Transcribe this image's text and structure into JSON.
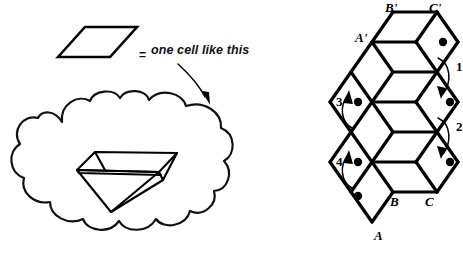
{
  "figure": {
    "title_text": "",
    "legend": {
      "equals_sign": "=",
      "caption": "one cell like this",
      "swatch_name": "rhombus-cell-swatch"
    },
    "cloud": {
      "name": "thought-cloud",
      "contains": "tetrahedron-sketch"
    },
    "lattice": {
      "name": "rhombus-strip-lattice",
      "vertex_labels": {
        "a_prime": "A'",
        "b_prime": "B'",
        "c_prime": "C'",
        "a": "A",
        "b": "B",
        "c": "C"
      },
      "step_labels": [
        "1",
        "2",
        "3",
        "4"
      ],
      "dot_count": 6
    },
    "colors": {
      "ink": "#000000",
      "cloud_ink": "#111111",
      "background": "#ffffff"
    }
  }
}
